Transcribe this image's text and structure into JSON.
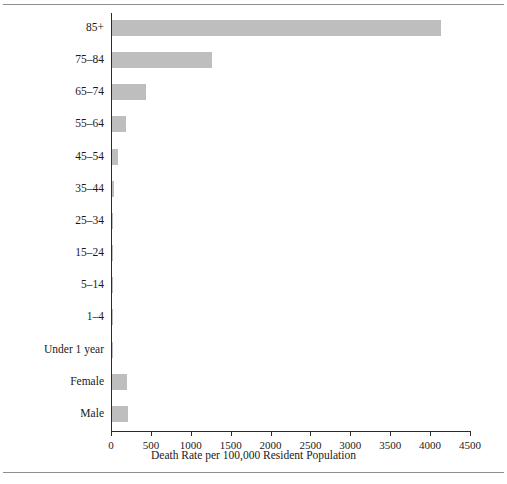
{
  "chart_data": {
    "type": "bar",
    "orientation": "horizontal",
    "title": "",
    "xlabel": "Death Rate per 100,000 Resident Population",
    "ylabel": "",
    "xlim": [
      0,
      4500
    ],
    "xticks": [
      0,
      500,
      1000,
      1500,
      2000,
      2500,
      3000,
      3500,
      4000,
      4500
    ],
    "xtick_labels": [
      "0",
      "500",
      "1000",
      "1500",
      "2000",
      "2500",
      "3000",
      "3500",
      "4000",
      "4500"
    ],
    "grid": false,
    "legend": false,
    "bar_color": "#bebebe",
    "axis_color": "#2b2b2b",
    "categories": [
      "85+",
      "75–84",
      "65–74",
      "55–64",
      "45–54",
      "35–44",
      "25–34",
      "15–24",
      "5–14",
      "1–4",
      "Under 1 year",
      "Female",
      "Male"
    ],
    "values": [
      4120,
      1250,
      430,
      175,
      75,
      25,
      8,
      4,
      2,
      2,
      12,
      185,
      205
    ]
  },
  "figure": {
    "axis_title": "Death Rate per 100,000 Resident Population"
  }
}
